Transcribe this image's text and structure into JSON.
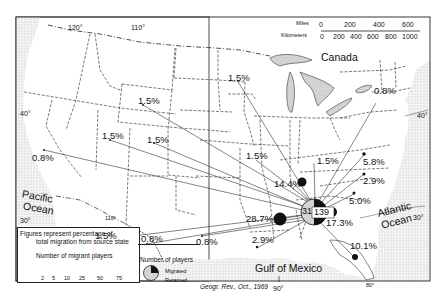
{
  "map": {
    "title_source": "Geogr. Rev., Oct., 1969",
    "longitudes": [
      "120°",
      "110°",
      "90°",
      "110°",
      "80°"
    ],
    "latitudes": [
      "40°",
      "40°",
      "30°",
      "30°"
    ],
    "regions": {
      "canada": "Canada",
      "pacific": "Pacific Ocean",
      "pacific_line1": "Pacific",
      "pacific_line2": "Ocean",
      "atlantic_line1": "Atlantic",
      "atlantic_line2": "Ocean",
      "gulf": "Gulf of Mexico"
    },
    "scale": {
      "miles_label": "Miles",
      "km_label": "Kilometers",
      "miles_ticks": [
        "0",
        "200",
        "400",
        "600"
      ],
      "km_ticks": [
        "0",
        "200",
        "400",
        "600",
        "800",
        "1000"
      ]
    },
    "destination": {
      "retained": "31",
      "migrated": "139"
    },
    "flows": [
      {
        "label": "1.5%",
        "note": "Montana/Wyoming"
      },
      {
        "label": "1.5%",
        "note": "Idaho/Utah west"
      },
      {
        "label": "1.5%",
        "note": "Utah/Colorado"
      },
      {
        "label": "0.8%",
        "note": "California"
      },
      {
        "label": "1.5%",
        "note": "Arizona"
      },
      {
        "label": "0.8%",
        "note": "New Mexico"
      },
      {
        "label": "0.8%",
        "note": "Texas west"
      },
      {
        "label": "1.5%",
        "note": "Minnesota/Iowa"
      },
      {
        "label": "1.5%",
        "note": "Missouri"
      },
      {
        "label": "1.5%",
        "note": "Kentucky"
      },
      {
        "label": "0.8%",
        "note": "New York"
      },
      {
        "label": "5.8%",
        "note": "Virginia"
      },
      {
        "label": "2.9%",
        "note": "North Carolina"
      },
      {
        "label": "5.0%",
        "note": "South Carolina"
      },
      {
        "label": "14.4%",
        "note": "Tennessee"
      },
      {
        "label": "28.7%",
        "note": "Mississippi"
      },
      {
        "label": "17.3%",
        "note": "Georgia"
      },
      {
        "label": "2.9%",
        "note": "Louisiana"
      },
      {
        "label": "10.1%",
        "note": "Florida"
      }
    ]
  },
  "legend": {
    "line1": "Figures represent percentage of",
    "line2": "total migration from source state",
    "sizes_title": "Number of  migrant players",
    "sizes": [
      "2",
      "5",
      "10",
      "25",
      "50",
      "75"
    ],
    "pie_title": "Number of players",
    "pie_migrated": "Migrated",
    "pie_retained": "Retained"
  }
}
